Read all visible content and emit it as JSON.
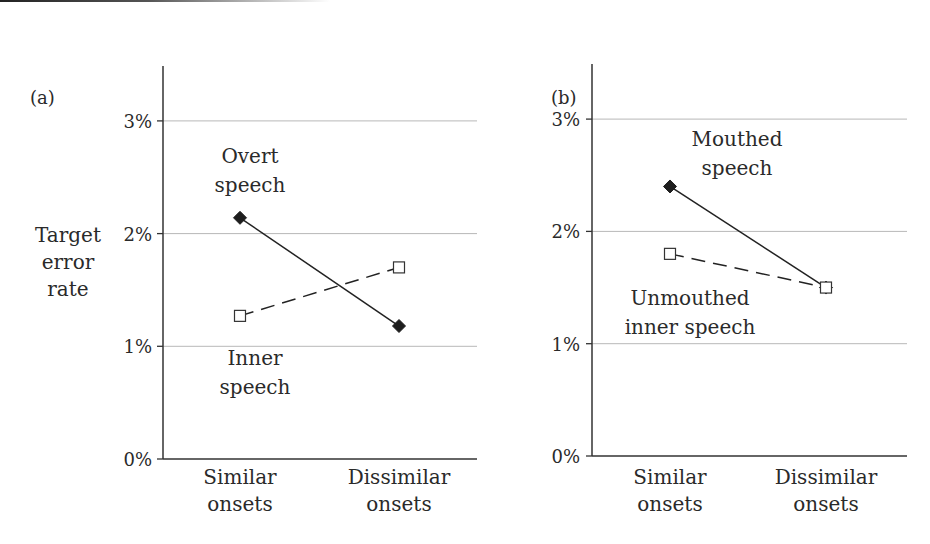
{
  "figure": {
    "top_rule": true
  },
  "chart_data": [
    {
      "type": "line",
      "panel_label": "(a)",
      "title": "",
      "ylabel": "Target error rate",
      "ylabel_lines": [
        "Target",
        "error",
        "rate"
      ],
      "xlabel": "",
      "categories": [
        "Similar onsets",
        "Dissimilar onsets"
      ],
      "category_lines": [
        [
          "Similar",
          "onsets"
        ],
        [
          "Dissimilar",
          "onsets"
        ]
      ],
      "ylim": [
        0,
        3.5
      ],
      "yticks": [
        0,
        1,
        2,
        3
      ],
      "ytick_labels": [
        "0%",
        "1%",
        "2%",
        "3%"
      ],
      "grid": true,
      "legend": "inline annotations",
      "series": [
        {
          "name": "Overt speech",
          "label_lines": [
            "Overt",
            "speech"
          ],
          "values": [
            2.14,
            1.18
          ],
          "marker": "filled-diamond",
          "line_style": "solid",
          "color": "#222222"
        },
        {
          "name": "Inner speech",
          "label_lines": [
            "Inner",
            "speech"
          ],
          "values": [
            1.27,
            1.7
          ],
          "marker": "open-square",
          "line_style": "dashed",
          "color": "#222222"
        }
      ]
    },
    {
      "type": "line",
      "panel_label": "(b)",
      "title": "",
      "ylabel": "",
      "xlabel": "",
      "categories": [
        "Similar onsets",
        "Dissimilar onsets"
      ],
      "category_lines": [
        [
          "Similar",
          "onsets"
        ],
        [
          "Dissimilar",
          "onsets"
        ]
      ],
      "ylim": [
        0,
        3.5
      ],
      "yticks": [
        0,
        1,
        2,
        3
      ],
      "ytick_labels": [
        "0%",
        "1%",
        "2%",
        "3%"
      ],
      "grid": true,
      "legend": "inline annotations",
      "series": [
        {
          "name": "Mouthed speech",
          "label_lines": [
            "Mouthed",
            "speech"
          ],
          "values": [
            2.4,
            1.5
          ],
          "marker": "filled-diamond",
          "line_style": "solid",
          "color": "#222222"
        },
        {
          "name": "Unmouthed inner speech",
          "label_lines": [
            "Unmouthed",
            "inner speech"
          ],
          "values": [
            1.8,
            1.5
          ],
          "marker": "open-square",
          "line_style": "dashed",
          "color": "#222222"
        }
      ]
    }
  ]
}
